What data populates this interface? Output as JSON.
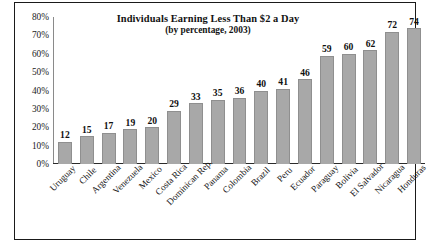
{
  "chart_data": {
    "type": "bar",
    "title": "Individuals Earning Less Than $2 a Day",
    "subtitle": "(by percentage, 2003)",
    "xlabel": "",
    "ylabel": "",
    "ylim": [
      0,
      80
    ],
    "ytick_labels": [
      "80%",
      "70%",
      "60%",
      "50%",
      "40%",
      "30%",
      "20%",
      "10%",
      "0%"
    ],
    "ytick_values": [
      80,
      70,
      60,
      50,
      40,
      30,
      20,
      10,
      0
    ],
    "grid": false,
    "legend": "none",
    "bar_color": "#a8a8a8",
    "bar_edge_color": "#8f8f8f",
    "value_labels_shown": true,
    "categories": [
      "Uruguay",
      "Chile",
      "Argentina",
      "Venezuela",
      "Mexico",
      "Costa Rica",
      "Dominican Rep.",
      "Panama",
      "Colombia",
      "Brazil",
      "Peru",
      "Ecuador",
      "Paraguay",
      "Bolivia",
      "El Salvador",
      "Nicaragua",
      "Honduras"
    ],
    "values": [
      12,
      15,
      17,
      19,
      20,
      29,
      33,
      35,
      36,
      40,
      41,
      46,
      59,
      60,
      62,
      72,
      74
    ],
    "value_labels": [
      "12",
      "15",
      "17",
      "19",
      "20",
      "29",
      "33",
      "35",
      "36",
      "40",
      "41",
      "46",
      "59",
      "60",
      "62",
      "72",
      "74"
    ]
  }
}
